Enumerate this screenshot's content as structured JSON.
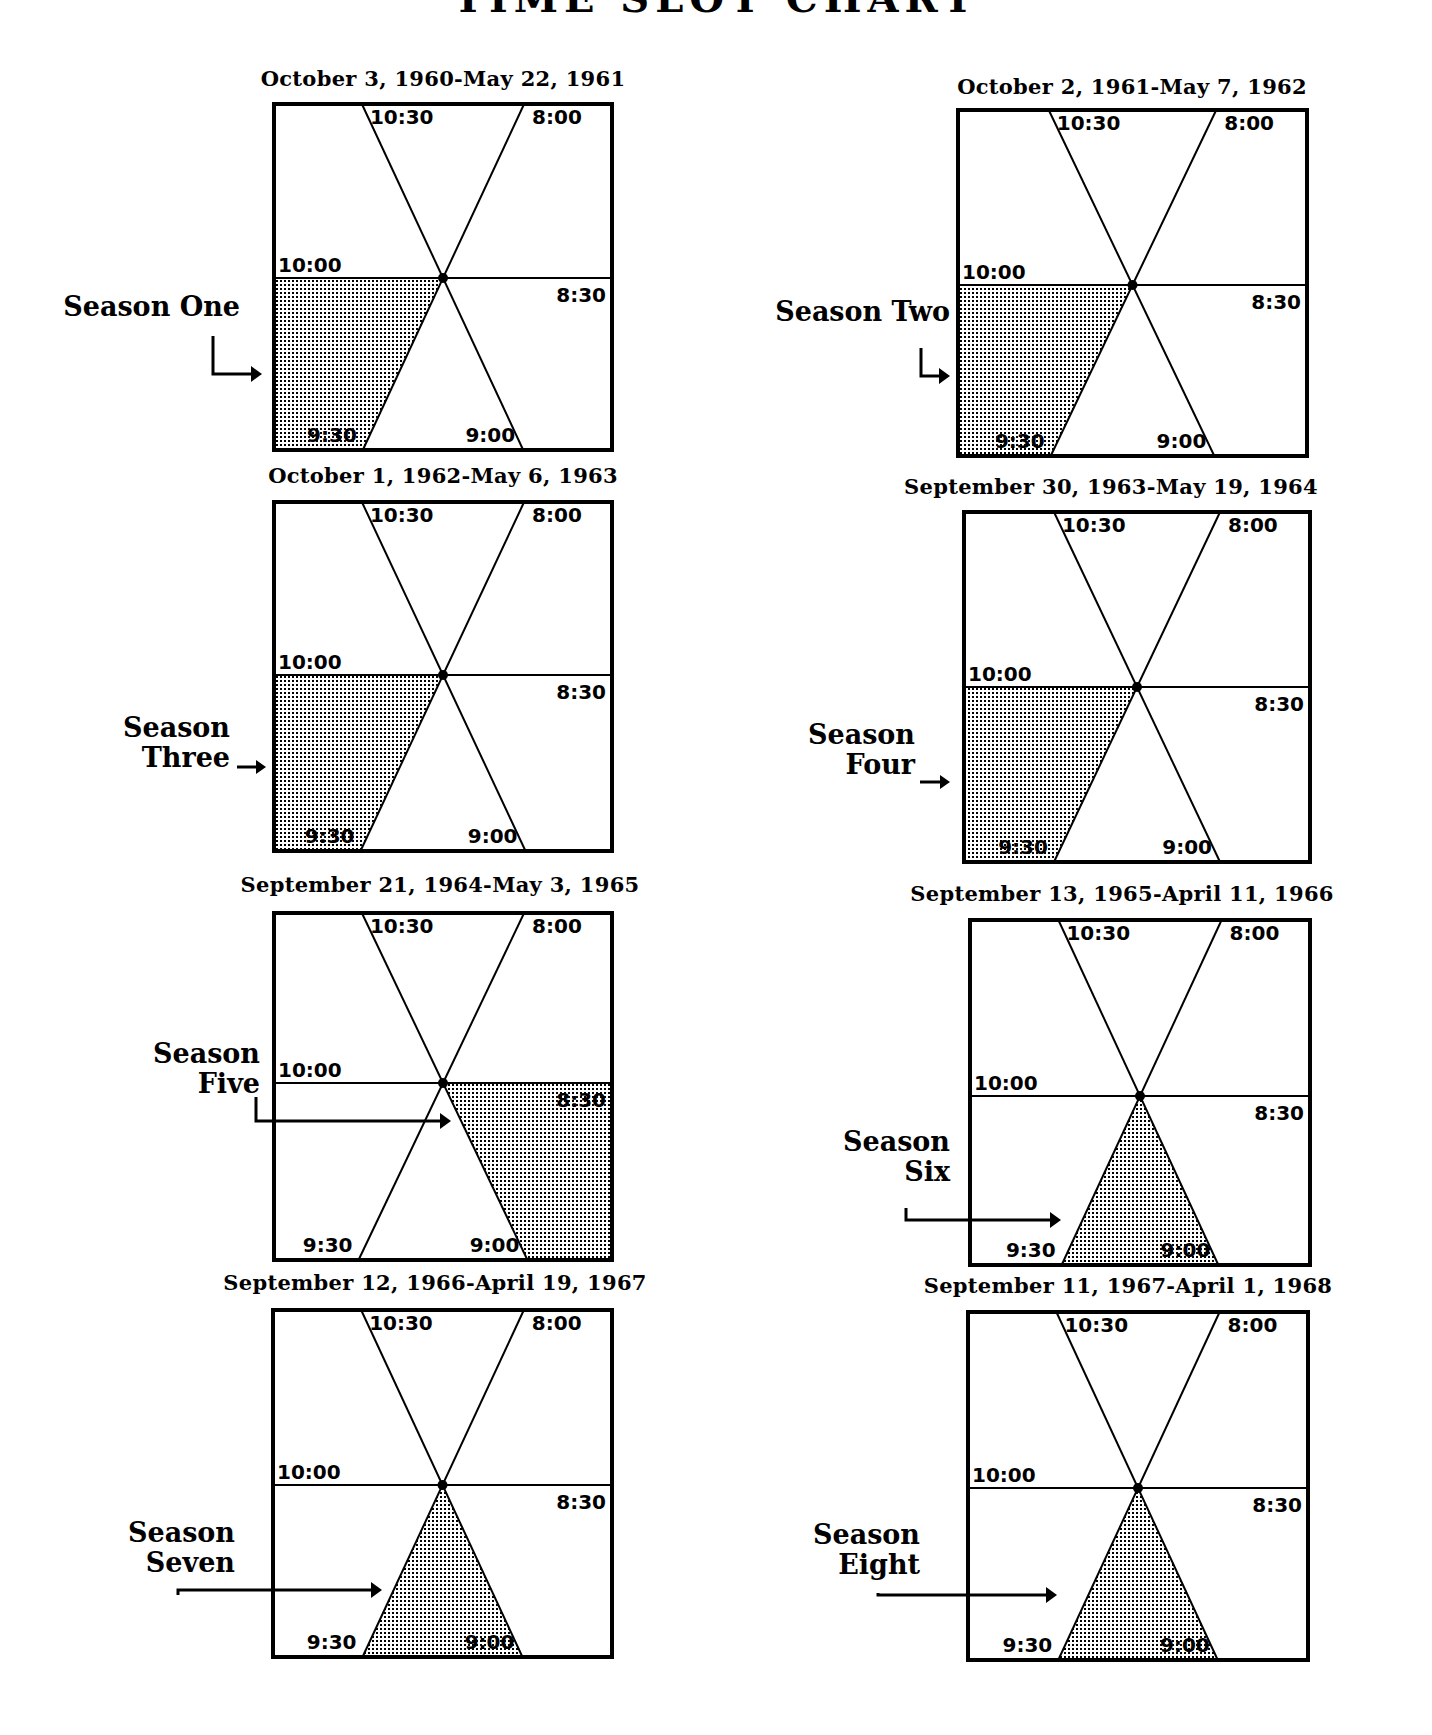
{
  "page": {
    "title": "TIME SLOT CHART"
  },
  "slot_labels": {
    "s1030": "10:30",
    "s800": "8:00",
    "s1000": "10:00",
    "s830": "8:30",
    "s930": "9:30",
    "s900": "9:00"
  },
  "colors": {
    "ink": "#000000",
    "background": "#ffffff",
    "shade_dot": "#000000"
  },
  "seasons": [
    {
      "label_line1": "Season One",
      "label_line2": "",
      "date_range": "October 3, 1960-May 22, 1961",
      "slot": "9:30"
    },
    {
      "label_line1": "Season Two",
      "label_line2": "",
      "date_range": "October 2, 1961-May 7, 1962",
      "slot": "9:30"
    },
    {
      "label_line1": "Season",
      "label_line2": "Three",
      "date_range": "October 1, 1962-May 6, 1963",
      "slot": "9:30"
    },
    {
      "label_line1": "Season",
      "label_line2": "Four",
      "date_range": "September 30, 1963-May 19, 1964",
      "slot": "9:30"
    },
    {
      "label_line1": "Season",
      "label_line2": "Five",
      "date_range": "September 21, 1964-May 3, 1965",
      "slot": "8:30"
    },
    {
      "label_line1": "Season",
      "label_line2": "Six",
      "date_range": "September 13, 1965-April 11, 1966",
      "slot": "9:00"
    },
    {
      "label_line1": "Season",
      "label_line2": "Seven",
      "date_range": "September 12, 1966-April 19, 1967",
      "slot": "9:00"
    },
    {
      "label_line1": "Season",
      "label_line2": "Eight",
      "date_range": "September 11, 1967-April 1, 1968",
      "slot": "9:00"
    }
  ],
  "chart_data": {
    "type": "table",
    "title": "TIME SLOT CHART",
    "slots": [
      "8:00",
      "8:30",
      "9:00",
      "9:30",
      "10:00",
      "10:30"
    ],
    "columns": [
      "Season",
      "Dates",
      "Time Slot"
    ],
    "rows": [
      [
        "Season One",
        "October 3, 1960-May 22, 1961",
        "9:30"
      ],
      [
        "Season Two",
        "October 2, 1961-May 7, 1962",
        "9:30"
      ],
      [
        "Season Three",
        "October 1, 1962-May 6, 1963",
        "9:30"
      ],
      [
        "Season Four",
        "September 30, 1963-May 19, 1964",
        "9:30"
      ],
      [
        "Season Five",
        "September 21, 1964-May 3, 1965",
        "8:30"
      ],
      [
        "Season Six",
        "September 13, 1965-April 11, 1966",
        "9:00"
      ],
      [
        "Season Seven",
        "September 12, 1966-April 19, 1967",
        "9:00"
      ],
      [
        "Season Eight",
        "September 11, 1967-April 1, 1968",
        "9:00"
      ]
    ]
  }
}
